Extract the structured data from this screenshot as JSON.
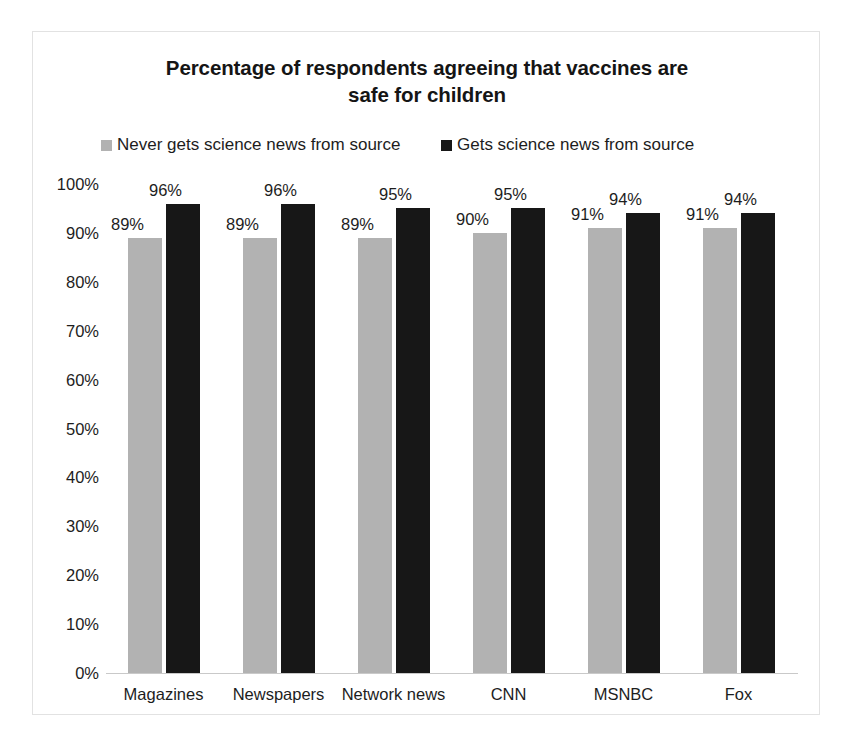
{
  "chart_data": {
    "type": "bar",
    "title": "Percentage of respondents agreeing that vaccines are safe for children",
    "title_line1": "Percentage of respondents agreeing that vaccines are",
    "title_line2": "safe for children",
    "xlabel": "",
    "ylabel": "",
    "ylim": [
      0,
      100
    ],
    "grid": false,
    "legend_position": "top",
    "categories": [
      "Magazines",
      "Newspapers",
      "Network news",
      "CNN",
      "MSNBC",
      "Fox"
    ],
    "ytick_labels": [
      "100%",
      "90%",
      "80%",
      "70%",
      "60%",
      "50%",
      "40%",
      "30%",
      "20%",
      "10%",
      "0%"
    ],
    "ytick_values": [
      100,
      90,
      80,
      70,
      60,
      50,
      40,
      30,
      20,
      10,
      0
    ],
    "series": [
      {
        "name": "Never gets science news from source",
        "color": "#b2b2b2",
        "values": [
          89,
          89,
          89,
          90,
          91,
          91
        ],
        "labels": [
          "89%",
          "89%",
          "89%",
          "90%",
          "91%",
          "91%"
        ]
      },
      {
        "name": "Gets science news from source",
        "color": "#171717",
        "values": [
          96,
          96,
          95,
          95,
          94,
          94
        ],
        "labels": [
          "96%",
          "96%",
          "95%",
          "95%",
          "94%",
          "94%"
        ]
      }
    ]
  }
}
